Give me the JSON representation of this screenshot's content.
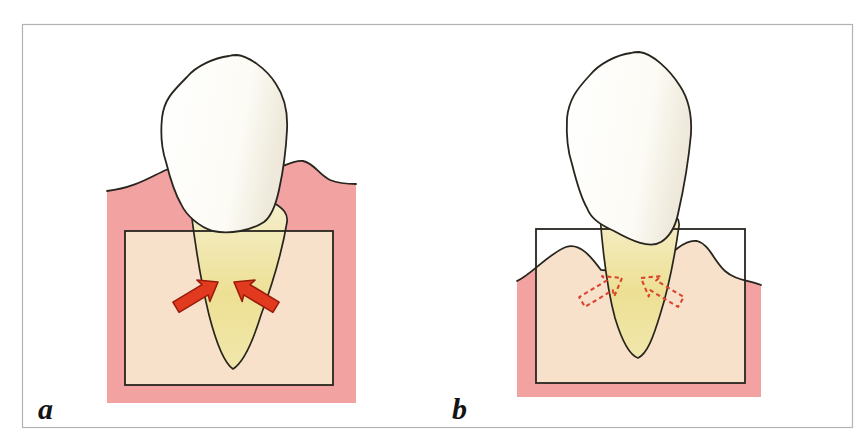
{
  "figure": {
    "kind": "dental-two-panel-illustration",
    "frame": {
      "background": "#ffffff",
      "border_color": "#b2b2b2"
    },
    "panels": [
      {
        "label": "a",
        "arrow_style": "solid",
        "arrow_count": 2,
        "gum_level": "high-covering-root"
      },
      {
        "label": "b",
        "arrow_style": "dashed-outline",
        "arrow_count": 2,
        "gum_level": "receded-root-exposed"
      }
    ],
    "colors": {
      "gum_pink": "#F2A3A1",
      "bone_beige": "#F8E1CB",
      "root_yellow": "#EDE094",
      "root_light": "#F5EFCC",
      "crown_white": "#FFFFFF",
      "crown_shade": "#EEE9DA",
      "arrow_red": "#E23A1E",
      "arrow_outline_red": "#9A1D0C",
      "dashed_arrow_red": "#D94530",
      "line_black": "#27251E",
      "label_color": "#141414"
    }
  }
}
